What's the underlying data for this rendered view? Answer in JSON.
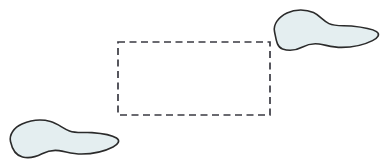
{
  "canvas": {
    "width": 386,
    "height": 164,
    "background_color": "#ffffff"
  },
  "palette": {
    "blob_fill": "#e4eef0",
    "blob_stroke": "#2b2b2b",
    "rect_stroke": "#3a3a42",
    "background": "#ffffff"
  },
  "shapes": {
    "blob_bottom_left": {
      "label": "",
      "fill": "#e4eef0",
      "stroke": "#2b2b2b",
      "stroke_width": 1.6,
      "bbox": {
        "x": 8,
        "y": 118,
        "width": 112,
        "height": 42
      },
      "path": "M 10.5 141.5 C 9.0 134.5, 14.0 127.5, 22.0 124.0 C 30.5 120.3, 41.5 119.0, 50.5 121.5 C 58.0 123.6, 63.0 128.5, 69.5 131.0 C 76.5 133.6, 84.5 132.0, 92.0 132.6 C 101.0 133.3, 111.0 134.5, 116.5 138.0 C 120.5 140.6, 118.5 144.2, 113.0 147.0 C 104.5 151.4, 92.0 154.0, 81.5 154.0 C 72.5 154.0, 66.0 151.6, 59.0 150.6 C 52.0 149.6, 47.0 151.2, 42.0 153.8 C 36.0 156.9, 29.0 158.6, 22.5 157.0 C 15.5 155.3, 12.0 148.6, 10.5 141.5 Z"
    },
    "blob_top_right": {
      "label": "",
      "fill": "#e4eef0",
      "stroke": "#2b2b2b",
      "stroke_width": 1.6,
      "bbox": {
        "x": 272,
        "y": 9,
        "width": 108,
        "height": 41
      },
      "path": "M 274.5 31.5 C 273.0 24.5, 278.5 17.0, 287.0 13.0 C 295.5 9.0, 306.0 9.2, 313.5 12.6 C 320.0 15.6, 323.5 21.0, 329.0 23.6 C 335.5 26.7, 343.5 25.2, 351.5 26.0 C 361.0 27.0, 371.5 28.4, 376.5 31.6 C 380.5 34.2, 378.0 37.8, 372.5 40.6 C 364.0 44.9, 352.0 47.4, 341.5 47.4 C 332.5 47.4, 326.0 45.0, 319.0 44.0 C 312.0 43.0, 307.0 44.6, 302.0 47.2 C 296.0 50.3, 289.0 51.2, 282.5 49.0 C 276.5 47.0, 276.0 38.5, 274.5 31.5 Z"
    },
    "dashed_rectangle": {
      "label": "",
      "stroke": "#3a3a42",
      "stroke_width": 1.7,
      "dash_array": "7 4.5",
      "fill": "none",
      "bbox": {
        "x": 118,
        "y": 42,
        "width": 152,
        "height": 73
      }
    }
  }
}
